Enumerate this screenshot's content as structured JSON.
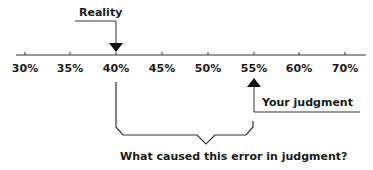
{
  "diagram": {
    "axis": {
      "ticks": [
        "30%",
        "35%",
        "40%",
        "45%",
        "50%",
        "55%",
        "60%",
        "70%"
      ]
    },
    "markers": {
      "reality": {
        "label": "Reality",
        "value": "40%"
      },
      "judgment": {
        "label": "Your judgment",
        "value": "55%"
      }
    },
    "brace_caption": "What caused this error in judgment?"
  }
}
